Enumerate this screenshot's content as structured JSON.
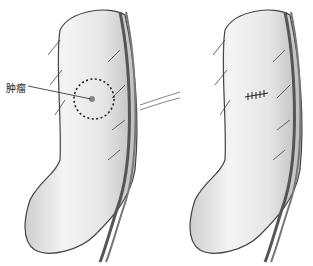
{
  "figure": {
    "panels": [
      {
        "name": "before",
        "annotation": {
          "label": "肿瘤"
        }
      },
      {
        "name": "after"
      }
    ]
  }
}
